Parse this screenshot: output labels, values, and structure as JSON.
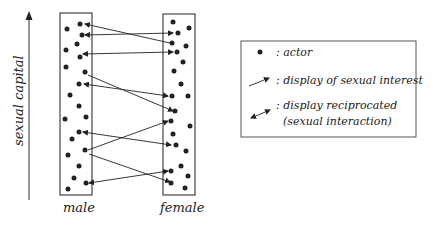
{
  "axis": {
    "label": "sexual capital"
  },
  "groups": {
    "male": "male",
    "female": "female"
  },
  "legend": {
    "actor": ": actor",
    "interest": ": display of sexual interest",
    "reciprocated_1": ": display reciprocated",
    "reciprocated_2": "(sexual interaction)"
  },
  "colors": {
    "ink": "#222222",
    "box": "#444444"
  }
}
